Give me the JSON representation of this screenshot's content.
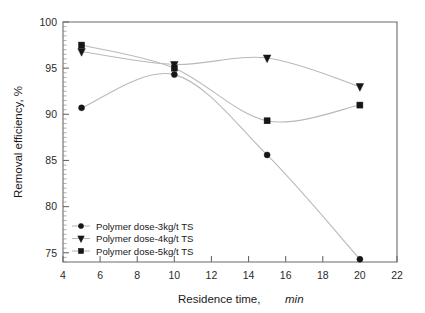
{
  "chart_data": {
    "type": "line",
    "title": "",
    "xlabel": "Residence time, min",
    "xlabel_plain": "Residence time,",
    "xlabel_italic": "min",
    "ylabel": "Removal efficiency, %",
    "xlim": [
      4,
      22
    ],
    "ylim": [
      74,
      100
    ],
    "x_ticks": [
      4,
      6,
      8,
      10,
      12,
      14,
      16,
      18,
      20,
      22
    ],
    "y_ticks": [
      75,
      80,
      85,
      90,
      95,
      100
    ],
    "x_tick_labels": [
      "4",
      "6",
      "8",
      "10",
      "12",
      "14",
      "16",
      "18",
      "20",
      "22"
    ],
    "y_tick_labels": [
      "75",
      "80",
      "85",
      "90",
      "95",
      "100"
    ],
    "grid": false,
    "legend_position": "lower-left",
    "x": [
      5,
      10,
      15,
      20
    ],
    "series": [
      {
        "name": "Polymer dose-3kg/t TS",
        "marker": "circle",
        "values": [
          90.7,
          94.3,
          85.6,
          74.3
        ]
      },
      {
        "name": "Polymer dose-4kg/t TS",
        "marker": "triangle-down",
        "values": [
          96.8,
          95.4,
          96.1,
          93.0
        ]
      },
      {
        "name": "Polymer dose-5kg/t TS",
        "marker": "square",
        "values": [
          97.5,
          95.0,
          89.3,
          91.0
        ]
      }
    ],
    "colors": {
      "line": "#b9b9b9",
      "marker": "#161616",
      "axis": "#6b6b6b",
      "text": "#1a1a1a",
      "background": "#ffffff"
    }
  },
  "legend": {
    "items": [
      {
        "label": "Polymer dose-3kg/t TS",
        "marker": "circle"
      },
      {
        "label": "Polymer dose-4kg/t TS",
        "marker": "triangle-down"
      },
      {
        "label": "Polymer dose-5kg/t TS",
        "marker": "square"
      }
    ]
  }
}
